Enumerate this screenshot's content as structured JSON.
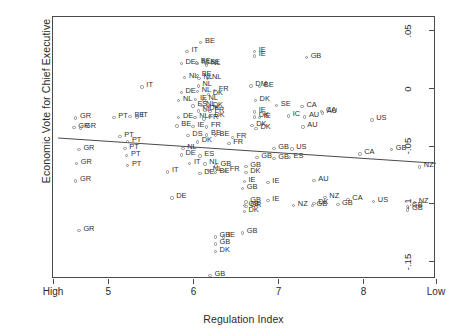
{
  "chart_data": {
    "type": "scatter",
    "title": "",
    "subtitle": "",
    "xlabel": "Regulation Index",
    "ylabel": "Economic Vote for Chief Executive",
    "grid": false,
    "legend": "none",
    "xlim": [
      4.35,
      8.85
    ],
    "ylim": [
      -0.165,
      0.062
    ],
    "xticks": [
      {
        "value": 4.35,
        "label": "High"
      },
      {
        "value": 5.0,
        "label": "5"
      },
      {
        "value": 6.0,
        "label": "6"
      },
      {
        "value": 7.0,
        "label": "7"
      },
      {
        "value": 8.0,
        "label": "8"
      },
      {
        "value": 8.85,
        "label": "Low"
      }
    ],
    "yticks": [
      {
        "value": 0.05,
        "label": ".05"
      },
      {
        "value": 0.0,
        "label": "0"
      },
      {
        "value": -0.05,
        "label": "-.05"
      },
      {
        "value": -0.1,
        "label": "-.1"
      },
      {
        "value": -0.15,
        "label": "-.15"
      }
    ],
    "annotations": [],
    "fit_line": {
      "name": "linear-fit",
      "x0": 4.41,
      "y0": -0.0428,
      "x1": 8.92,
      "y1": -0.0651,
      "color": "#4a4a4a"
    },
    "point_color": "#8c8c8c",
    "label_color": "#2f2f2f",
    "points": [
      {
        "label": "BE",
        "x": 6.09,
        "y": 0.0394
      },
      {
        "label": "IT",
        "x": 5.93,
        "y": 0.0321
      },
      {
        "label": "IE",
        "x": 6.72,
        "y": 0.0318
      },
      {
        "label": "IE",
        "x": 6.72,
        "y": 0.0278
      },
      {
        "label": "GB",
        "x": 7.33,
        "y": 0.0266
      },
      {
        "label": "DE",
        "x": 5.86,
        "y": 0.0214
      },
      {
        "label": "BE",
        "x": 6.04,
        "y": 0.022
      },
      {
        "label": "NL",
        "x": 6.05,
        "y": 0.0214
      },
      {
        "label": "BE",
        "x": 6.15,
        "y": 0.0216
      },
      {
        "label": "NL",
        "x": 6.16,
        "y": 0.02
      },
      {
        "label": "NL",
        "x": 5.9,
        "y": 0.0093
      },
      {
        "label": "BE",
        "x": 6.05,
        "y": 0.0112
      },
      {
        "label": "NL",
        "x": 6.07,
        "y": 0.0087
      },
      {
        "label": "NL",
        "x": 6.17,
        "y": 0.0085
      },
      {
        "label": "IT",
        "x": 5.4,
        "y": 0.001
      },
      {
        "label": "NL",
        "x": 6.06,
        "y": 0.002
      },
      {
        "label": "DM",
        "x": 6.68,
        "y": 0.002
      },
      {
        "label": "BE",
        "x": 6.78,
        "y": 0.0013
      },
      {
        "label": "DE",
        "x": 5.86,
        "y": -0.0036
      },
      {
        "label": "NL",
        "x": 6.05,
        "y": -0.0028
      },
      {
        "label": "DK",
        "x": 6.18,
        "y": -0.0054
      },
      {
        "label": "FR",
        "x": 6.25,
        "y": -0.002
      },
      {
        "label": "NL",
        "x": 5.83,
        "y": -0.0105
      },
      {
        "label": "IE",
        "x": 6.03,
        "y": -0.01
      },
      {
        "label": "NL",
        "x": 6.13,
        "y": -0.0103
      },
      {
        "label": "DK",
        "x": 6.73,
        "y": -0.0105
      },
      {
        "label": "ES",
        "x": 6.0,
        "y": -0.0153
      },
      {
        "label": "NL",
        "x": 6.1,
        "y": -0.0147
      },
      {
        "label": "DK",
        "x": 6.18,
        "y": -0.0157
      },
      {
        "label": "SE",
        "x": 6.98,
        "y": -0.0147
      },
      {
        "label": "CA",
        "x": 7.28,
        "y": -0.0156
      },
      {
        "label": "NL",
        "x": 6.06,
        "y": -0.0198
      },
      {
        "label": "DK",
        "x": 6.14,
        "y": -0.019
      },
      {
        "label": "FR",
        "x": 6.2,
        "y": -0.0204
      },
      {
        "label": "IE",
        "x": 6.72,
        "y": -0.0206
      },
      {
        "label": "CA",
        "x": 7.51,
        "y": -0.0204
      },
      {
        "label": "GR",
        "x": 4.62,
        "y": -0.0258
      },
      {
        "label": "PT",
        "x": 5.07,
        "y": -0.0255
      },
      {
        "label": "BE",
        "x": 5.26,
        "y": -0.0243
      },
      {
        "label": "IT",
        "x": 5.34,
        "y": -0.025
      },
      {
        "label": "DE",
        "x": 5.83,
        "y": -0.0256
      },
      {
        "label": "NL",
        "x": 6.02,
        "y": -0.0254
      },
      {
        "label": "FR",
        "x": 6.13,
        "y": -0.0268
      },
      {
        "label": "DK",
        "x": 6.2,
        "y": -0.0246
      },
      {
        "label": "DK",
        "x": 6.72,
        "y": -0.025
      },
      {
        "label": "IE",
        "x": 6.78,
        "y": -0.0255
      },
      {
        "label": "IC",
        "x": 7.12,
        "y": -0.024
      },
      {
        "label": "AU",
        "x": 7.31,
        "y": -0.0248
      },
      {
        "label": "AU",
        "x": 7.52,
        "y": -0.0215
      },
      {
        "label": "US",
        "x": 8.1,
        "y": -0.0275
      },
      {
        "label": "GR",
        "x": 4.6,
        "y": -0.034
      },
      {
        "label": "GR",
        "x": 4.68,
        "y": -0.0345
      },
      {
        "label": "BE",
        "x": 5.81,
        "y": -0.0328
      },
      {
        "label": "IE",
        "x": 6.0,
        "y": -0.033
      },
      {
        "label": "FR",
        "x": 6.16,
        "y": -0.0336
      },
      {
        "label": "DK",
        "x": 6.69,
        "y": -0.0325
      },
      {
        "label": "DK",
        "x": 6.74,
        "y": -0.035
      },
      {
        "label": "AU",
        "x": 7.29,
        "y": -0.0335
      },
      {
        "label": "PT",
        "x": 5.14,
        "y": -0.0418
      },
      {
        "label": "DS",
        "x": 5.94,
        "y": -0.041
      },
      {
        "label": "BE",
        "x": 6.16,
        "y": -0.0405
      },
      {
        "label": "BE",
        "x": 6.26,
        "y": -0.0408
      },
      {
        "label": "FR",
        "x": 6.46,
        "y": -0.0425
      },
      {
        "label": "PT",
        "x": 5.23,
        "y": -0.046
      },
      {
        "label": "DK",
        "x": 6.05,
        "y": -0.0466
      },
      {
        "label": "FR",
        "x": 6.42,
        "y": -0.0478
      },
      {
        "label": "GR",
        "x": 4.66,
        "y": -0.053
      },
      {
        "label": "PT",
        "x": 5.2,
        "y": -0.0522
      },
      {
        "label": "NL",
        "x": 5.88,
        "y": -0.052
      },
      {
        "label": "GB",
        "x": 6.95,
        "y": -0.052
      },
      {
        "label": "US",
        "x": 7.16,
        "y": -0.0527
      },
      {
        "label": "CA",
        "x": 7.96,
        "y": -0.057
      },
      {
        "label": "GB",
        "x": 8.33,
        "y": -0.053
      },
      {
        "label": "PT",
        "x": 5.22,
        "y": -0.0585
      },
      {
        "label": "DE",
        "x": 5.86,
        "y": -0.0578
      },
      {
        "label": "ES",
        "x": 6.08,
        "y": -0.0588
      },
      {
        "label": "GB",
        "x": 6.75,
        "y": -0.06
      },
      {
        "label": "GB",
        "x": 6.95,
        "y": -0.061
      },
      {
        "label": "ES",
        "x": 7.13,
        "y": -0.06
      },
      {
        "label": "GR",
        "x": 4.63,
        "y": -0.065
      },
      {
        "label": "PT",
        "x": 5.23,
        "y": -0.0668
      },
      {
        "label": "IT",
        "x": 5.96,
        "y": -0.065
      },
      {
        "label": "NL",
        "x": 6.14,
        "y": -0.0655
      },
      {
        "label": "GB",
        "x": 6.27,
        "y": -0.0675
      },
      {
        "label": "GB",
        "x": 6.62,
        "y": -0.068
      },
      {
        "label": "NZ",
        "x": 8.66,
        "y": -0.0682
      },
      {
        "label": "IT",
        "x": 5.7,
        "y": -0.0726
      },
      {
        "label": "DE",
        "x": 6.08,
        "y": -0.074
      },
      {
        "label": "NL",
        "x": 6.18,
        "y": -0.0715
      },
      {
        "label": "BE",
        "x": 6.26,
        "y": -0.073
      },
      {
        "label": "FR",
        "x": 6.38,
        "y": -0.0718
      },
      {
        "label": "DK",
        "x": 6.62,
        "y": -0.073
      },
      {
        "label": "GR",
        "x": 4.62,
        "y": -0.0805
      },
      {
        "label": "IE",
        "x": 6.6,
        "y": -0.081
      },
      {
        "label": "IE",
        "x": 6.88,
        "y": -0.0818
      },
      {
        "label": "AU",
        "x": 7.42,
        "y": -0.08
      },
      {
        "label": "GB",
        "x": 6.58,
        "y": -0.087
      },
      {
        "label": "DE",
        "x": 5.75,
        "y": -0.095
      },
      {
        "label": "GB",
        "x": 6.62,
        "y": -0.0985
      },
      {
        "label": "IE",
        "x": 6.88,
        "y": -0.097
      },
      {
        "label": "NZ",
        "x": 7.55,
        "y": -0.0945
      },
      {
        "label": "GB",
        "x": 6.6,
        "y": -0.1018
      },
      {
        "label": "GR",
        "x": 6.62,
        "y": -0.1022
      },
      {
        "label": "NZ",
        "x": 7.18,
        "y": -0.1015
      },
      {
        "label": "GB",
        "x": 7.4,
        "y": -0.1018
      },
      {
        "label": "CA",
        "x": 7.82,
        "y": -0.0965
      },
      {
        "label": "DK",
        "x": 7.42,
        "y": -0.1
      },
      {
        "label": "GB",
        "x": 7.7,
        "y": -0.1005
      },
      {
        "label": "US",
        "x": 8.12,
        "y": -0.098
      },
      {
        "label": "NZ",
        "x": 8.6,
        "y": -0.099
      },
      {
        "label": "GB",
        "x": 8.52,
        "y": -0.1025
      },
      {
        "label": "GB",
        "x": 8.52,
        "y": -0.1055
      },
      {
        "label": "DK",
        "x": 6.6,
        "y": -0.107
      },
      {
        "label": "GR",
        "x": 4.66,
        "y": -0.1235
      },
      {
        "label": "GB",
        "x": 6.58,
        "y": -0.1255
      },
      {
        "label": "GB",
        "x": 6.26,
        "y": -0.129
      },
      {
        "label": "IE",
        "x": 6.36,
        "y": -0.1288
      },
      {
        "label": "GB",
        "x": 6.26,
        "y": -0.1348
      },
      {
        "label": "DK",
        "x": 6.26,
        "y": -0.1412
      },
      {
        "label": "GB",
        "x": 6.2,
        "y": -0.162
      }
    ]
  }
}
